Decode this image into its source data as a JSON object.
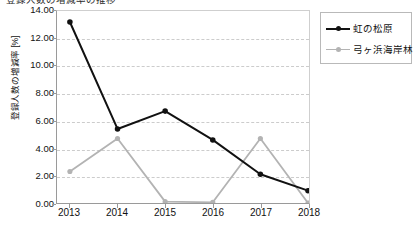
{
  "chart_data": {
    "type": "line",
    "title": "登録人数の増減率の推移",
    "xlabel": "",
    "ylabel": "登録人数の増減率 [%]",
    "categories": [
      "2013",
      "2014",
      "2015",
      "2016",
      "2017",
      "2018"
    ],
    "ylim": [
      0.0,
      14.0
    ],
    "yticks": [
      "0.00",
      "2.00",
      "4.00",
      "6.00",
      "8.00",
      "10.00",
      "12.00",
      "14.00"
    ],
    "ytick_values": [
      0.0,
      2.0,
      4.0,
      6.0,
      8.0,
      10.0,
      12.0,
      14.0
    ],
    "grid": true,
    "legend_position": "right",
    "series": [
      {
        "name": "虹の松原",
        "color": "#111111",
        "marker": "filled-circle",
        "values": [
          13.2,
          5.4,
          6.7,
          4.6,
          2.1,
          0.9
        ]
      },
      {
        "name": "弓ヶ浜海岸林",
        "color": "#b3b3b3",
        "marker": "filled-circle",
        "values": [
          2.3,
          4.7,
          0.1,
          0.05,
          4.7,
          0.0
        ]
      }
    ]
  },
  "legend": {
    "items": [
      {
        "label": "虹の松原"
      },
      {
        "label": "弓ヶ浜海岸林"
      }
    ]
  },
  "colors": {
    "series_1": "#111111",
    "series_2": "#b3b3b3",
    "axis": "#9a9a9a",
    "grid": "#cccccc",
    "background": "#ffffff"
  }
}
